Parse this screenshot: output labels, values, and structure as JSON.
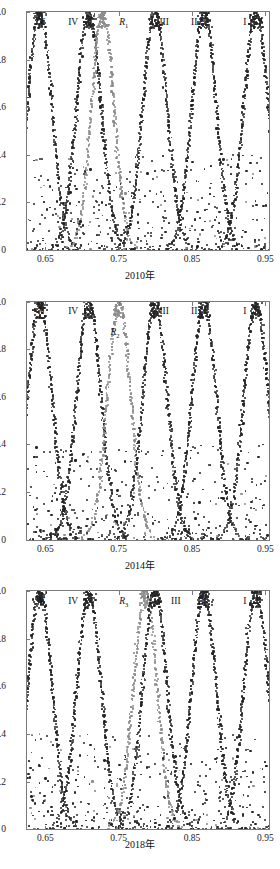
{
  "figure": {
    "width": 280,
    "height": 869,
    "panel_count": 3,
    "colors": {
      "series_dark": "#262626",
      "series_gray": "#8c8c8c",
      "axis": "#7a7a7a",
      "text": "#111111",
      "background": "#ffffff"
    }
  },
  "chart_data": [
    {
      "type": "scatter",
      "title": "",
      "xlabel": "2010年",
      "ylabel": "",
      "xlim": [
        0.625,
        0.955
      ],
      "ylim": [
        0,
        1.0
      ],
      "xticks": [
        0.65,
        0.75,
        0.85,
        0.95
      ],
      "xticklabels": [
        "0.65",
        "0.75",
        "0.85",
        "0.95"
      ],
      "yticks": [
        0,
        0.2,
        0.4,
        0.6,
        0.8,
        1.0
      ],
      "yticklabels": [
        "0",
        "0.2",
        "0.4",
        "0.6",
        "0.8",
        "1.0"
      ],
      "grid": false,
      "legend": "none",
      "annotations": [
        {
          "text": "V",
          "x": 0.645,
          "y": 0.955,
          "series": "dark"
        },
        {
          "text": "IV",
          "x": 0.688,
          "y": 0.955,
          "series": "dark"
        },
        {
          "text": "R",
          "sub": "1",
          "x": 0.757,
          "y": 0.955,
          "series": "gray",
          "italic": true
        },
        {
          "text": "III",
          "x": 0.812,
          "y": 0.955,
          "series": "dark"
        },
        {
          "text": "II",
          "x": 0.853,
          "y": 0.955,
          "series": "dark"
        },
        {
          "text": "I",
          "x": 0.922,
          "y": 0.955,
          "series": "dark"
        }
      ],
      "series": [
        {
          "name": "V",
          "color": "dark",
          "center": 0.6425,
          "width": 0.0235,
          "n": 300
        },
        {
          "name": "IV",
          "color": "dark",
          "center": 0.7095,
          "width": 0.0235,
          "n": 300
        },
        {
          "name": "R1",
          "color": "gray",
          "center": 0.7285,
          "width": 0.0215,
          "n": 270
        },
        {
          "name": "III",
          "color": "dark",
          "center": 0.7995,
          "width": 0.0235,
          "n": 300
        },
        {
          "name": "II",
          "color": "dark",
          "center": 0.8665,
          "width": 0.0235,
          "n": 300
        },
        {
          "name": "I",
          "color": "dark",
          "center": 0.9375,
          "width": 0.0235,
          "n": 300
        }
      ],
      "noise_points": 430
    },
    {
      "type": "scatter",
      "title": "",
      "xlabel": "2014年",
      "ylabel": "",
      "xlim": [
        0.625,
        0.955
      ],
      "ylim": [
        0,
        1.0
      ],
      "xticks": [
        0.65,
        0.75,
        0.85,
        0.95
      ],
      "xticklabels": [
        "0.65",
        "0.75",
        "0.85",
        "0.95"
      ],
      "yticks": [
        0,
        0.2,
        0.4,
        0.6,
        0.8,
        1.0
      ],
      "yticklabels": [
        "0",
        "0.2",
        "0.4",
        "0.6",
        "0.8",
        "1.0"
      ],
      "grid": false,
      "legend": "none",
      "annotations": [
        {
          "text": "V",
          "x": 0.645,
          "y": 0.955,
          "series": "dark"
        },
        {
          "text": "IV",
          "x": 0.688,
          "y": 0.955,
          "series": "dark"
        },
        {
          "text": "R",
          "sub": "2",
          "x": 0.745,
          "y": 0.868,
          "series": "gray",
          "italic": true
        },
        {
          "text": "III",
          "x": 0.812,
          "y": 0.955,
          "series": "dark"
        },
        {
          "text": "II",
          "x": 0.853,
          "y": 0.955,
          "series": "dark"
        },
        {
          "text": "I",
          "x": 0.922,
          "y": 0.955,
          "series": "dark"
        }
      ],
      "series": [
        {
          "name": "V",
          "color": "dark",
          "center": 0.6425,
          "width": 0.0235,
          "n": 300
        },
        {
          "name": "IV",
          "color": "dark",
          "center": 0.7095,
          "width": 0.0235,
          "n": 300
        },
        {
          "name": "R2",
          "color": "gray",
          "center": 0.7505,
          "width": 0.0225,
          "n": 285
        },
        {
          "name": "III",
          "color": "dark",
          "center": 0.7995,
          "width": 0.0235,
          "n": 300
        },
        {
          "name": "II",
          "color": "dark",
          "center": 0.8665,
          "width": 0.0235,
          "n": 300
        },
        {
          "name": "I",
          "color": "dark",
          "center": 0.9375,
          "width": 0.0235,
          "n": 300
        }
      ],
      "noise_points": 430
    },
    {
      "type": "scatter",
      "title": "",
      "xlabel": "2018年",
      "ylabel": "",
      "xlim": [
        0.625,
        0.955
      ],
      "ylim": [
        0,
        1.0
      ],
      "xticks": [
        0.65,
        0.75,
        0.85,
        0.95
      ],
      "xticklabels": [
        "0.65",
        "0.75",
        "0.85",
        "0.95"
      ],
      "yticks": [
        0,
        0.2,
        0.4,
        0.6,
        0.8,
        1.0
      ],
      "yticklabels": [
        "0",
        "0.2",
        "0.4",
        "0.6",
        "0.8",
        "1.0"
      ],
      "grid": false,
      "legend": "none",
      "annotations": [
        {
          "text": "V",
          "x": 0.645,
          "y": 0.955,
          "series": "dark"
        },
        {
          "text": "IV",
          "x": 0.688,
          "y": 0.955,
          "series": "dark"
        },
        {
          "text": "R",
          "sub": "3",
          "x": 0.757,
          "y": 0.955,
          "series": "gray",
          "italic": true
        },
        {
          "text": "III",
          "x": 0.828,
          "y": 0.955,
          "series": "dark"
        },
        {
          "text": "II",
          "x": 0.862,
          "y": 0.955,
          "series": "dark"
        },
        {
          "text": "I",
          "x": 0.922,
          "y": 0.955,
          "series": "dark"
        }
      ],
      "series": [
        {
          "name": "V",
          "color": "dark",
          "center": 0.6425,
          "width": 0.0235,
          "n": 300
        },
        {
          "name": "IV",
          "color": "dark",
          "center": 0.7095,
          "width": 0.0235,
          "n": 300
        },
        {
          "name": "R3",
          "color": "gray",
          "center": 0.7865,
          "width": 0.0225,
          "n": 285
        },
        {
          "name": "III",
          "color": "dark",
          "center": 0.7995,
          "width": 0.0235,
          "n": 300
        },
        {
          "name": "II",
          "color": "dark",
          "center": 0.8665,
          "width": 0.0235,
          "n": 300
        },
        {
          "name": "I",
          "color": "dark",
          "center": 0.9375,
          "width": 0.0235,
          "n": 300
        }
      ],
      "noise_points": 430
    }
  ]
}
